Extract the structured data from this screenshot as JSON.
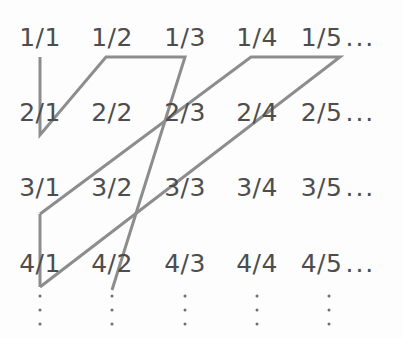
{
  "figure": {
    "type": "cantor-diagonal-enumeration",
    "stroke_color": "#8d8d8d",
    "text_color": "#4d4d4d",
    "background_color": "#fdfdfd",
    "stroke_width": 3
  },
  "grid": {
    "column_centers": [
      40,
      112,
      185,
      257,
      329
    ],
    "row_centers": [
      37,
      112,
      187,
      263
    ],
    "ellipsis_text": "...",
    "vertical_dots_symbol": "⋮",
    "rows": [
      {
        "numerator": "1",
        "cells": [
          "1/1",
          "1/2",
          "1/3",
          "1/4",
          "1/5"
        ],
        "trailing_ellipsis": "..."
      },
      {
        "numerator": "2",
        "cells": [
          "2/1",
          "2/2",
          "2/3",
          "2/4",
          "2/5"
        ],
        "trailing_ellipsis": "..."
      },
      {
        "numerator": "3",
        "cells": [
          "3/1",
          "3/2",
          "3/3",
          "3/4",
          "3/5"
        ],
        "trailing_ellipsis": "..."
      },
      {
        "numerator": "4",
        "cells": [
          "4/1",
          "4/2",
          "4/3",
          "4/4",
          "4/5"
        ],
        "trailing_ellipsis": "..."
      }
    ],
    "column_dots": [
      "⋮",
      "⋮",
      "⋮",
      "⋮",
      "⋮"
    ]
  },
  "path": {
    "description": "zigzag enumeration path",
    "segments": [
      {
        "name": "seg-col1-down-1",
        "points": "40,57 40,135"
      },
      {
        "name": "seg-diag-up-1",
        "points": "40,135 105,57"
      },
      {
        "name": "seg-horiz-1",
        "points": "105,57 185,57"
      },
      {
        "name": "seg-diag-down-1",
        "points": "185,57 112,290"
      },
      {
        "name": "seg-col1-down-2",
        "points": "40,215 40,287"
      },
      {
        "name": "seg-diag-up-2",
        "points": "40,215 250,57"
      },
      {
        "name": "seg-horiz-2",
        "points": "250,57 340,57"
      },
      {
        "name": "seg-diag-down-2",
        "points": "340,57 40,287"
      }
    ]
  }
}
